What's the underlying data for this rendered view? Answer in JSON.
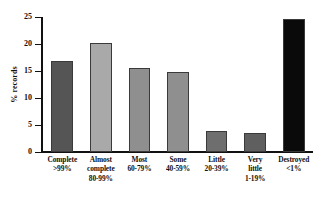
{
  "chart_data": {
    "type": "bar",
    "title": "",
    "xlabel": "",
    "ylabel": "% records",
    "ylim": [
      0,
      25
    ],
    "yticks": [
      0,
      5,
      10,
      15,
      20,
      25
    ],
    "ytick_labels": [
      "0",
      "5",
      "10",
      "15",
      "20",
      "25"
    ],
    "grid": false,
    "legend": "none",
    "categories": [
      "Complete\n>99%",
      "Almost complete\n80-99%",
      "Most\n60-79%",
      "Some\n40-59%",
      "Little\n20-39%",
      "Very little\n1-19%",
      "Destroyed\n<1%"
    ],
    "category_lines": [
      [
        "Complete",
        ">99%"
      ],
      [
        "Almost",
        "complete",
        "80-99%"
      ],
      [
        "Most",
        "60-79%"
      ],
      [
        "Some",
        "40-59%"
      ],
      [
        "Little",
        "20-39%"
      ],
      [
        "Very",
        "little",
        "1-19%"
      ],
      [
        "Destroyed",
        "<1%"
      ]
    ],
    "values": [
      16.9,
      20.2,
      15.5,
      14.8,
      3.9,
      3.5,
      24.7
    ],
    "bar_colors": [
      "#555555",
      "#a9a9a9",
      "#8f8f8f",
      "#8f8f8f",
      "#6e6e6e",
      "#5f5f5f",
      "#0a0a0a"
    ],
    "bar_edge_color": "#3a3a3a",
    "axis_color": "#111111",
    "background_color": "#ffffff"
  }
}
